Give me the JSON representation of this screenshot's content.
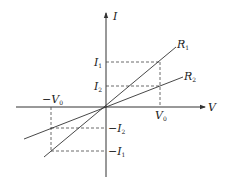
{
  "diagram": {
    "axes": {
      "x_label": "V",
      "y_label": "I"
    },
    "lines": [
      {
        "name": "R",
        "subscript": "1",
        "description": "steeper line through origin"
      },
      {
        "name": "R",
        "subscript": "2",
        "description": "shallower line through origin"
      }
    ],
    "tick_labels": {
      "v0": {
        "text": "V",
        "sub": "0"
      },
      "neg_v0": {
        "text": "−V",
        "sub": "0"
      },
      "i1": {
        "text": "I",
        "sub": "1"
      },
      "i2": {
        "text": "I",
        "sub": "2"
      },
      "neg_i1": {
        "text": "−I",
        "sub": "1"
      },
      "neg_i2": {
        "text": "−I",
        "sub": "2"
      }
    }
  }
}
